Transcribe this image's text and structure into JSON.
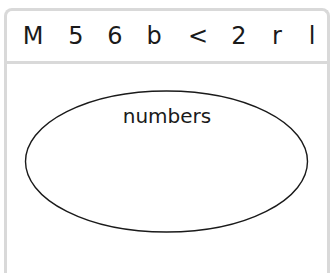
{
  "header": {
    "symbols": [
      "M",
      "5",
      "6",
      "b",
      "<",
      "2",
      "r",
      "l"
    ]
  },
  "diagram": {
    "set_label": "numbers",
    "stroke_color": "#1a1a1a",
    "frame_color": "#d9d9d9"
  }
}
